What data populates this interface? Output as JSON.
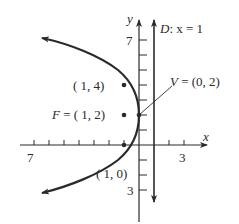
{
  "figure": {
    "type": "parabola-graph",
    "equation_context": "parabola with vertex V, focus F, directrix D",
    "colors": {
      "ink": "#2a2a2a",
      "background": "#ffffff"
    }
  },
  "axes": {
    "x_label": "x",
    "y_label": "y",
    "x_tick_labels": {
      "left": "7",
      "right": "3"
    },
    "y_tick_labels": {
      "top": "7",
      "bottom": "3"
    },
    "unit_px": 15,
    "origin_px": [
      139,
      145
    ]
  },
  "directrix": {
    "label": "D: x = 1",
    "label_D": "D",
    "label_rest": ": x = 1"
  },
  "points": {
    "vertex": {
      "label": "V = (0, 2)",
      "x": 0,
      "y": 2
    },
    "focus": {
      "label": "F = ( 1, 2)",
      "x": -1,
      "y": 2
    },
    "upper": {
      "label": "( 1, 4)",
      "x": -1,
      "y": 4
    },
    "lower": {
      "label": "( 1, 0)",
      "x": -1,
      "y": 0
    }
  },
  "labels": {
    "V_prefix": "V",
    "V_rest": " = (0, 2)",
    "F_prefix": "F",
    "F_rest": " = ( 1, 2)",
    "p14": "( 1, 4)",
    "p10": "( 1, 0)",
    "x": "x",
    "y": "y",
    "D": "D",
    "D_rest": ": x = 1",
    "xt_left": "7",
    "xt_right": "3",
    "yt_top": "7",
    "yt_bottom": "3"
  }
}
